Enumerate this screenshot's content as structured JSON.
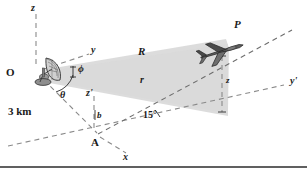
{
  "figure": {
    "background_color": "#ffffff",
    "beam_color": "#d9d9d9",
    "line_color": "#8a8a8a",
    "text_color": "#1a1a1a",
    "width": 307,
    "height": 171
  },
  "labels": {
    "z_axis": "z",
    "y_axis": "y",
    "x_axis": "x",
    "z_prime_axis": "z'",
    "y_prime_axis": "y'",
    "origin": "O",
    "plane_point": "P",
    "ground_point": "A",
    "range_R": "R",
    "range_r": "r",
    "altitude_z": "z",
    "baseline_distance": "3 km",
    "angle_phi": "ϕ",
    "angle_theta": "θ",
    "angle_fifteen": "15°",
    "b_label": "b"
  },
  "icons": {
    "radar_dish": "radar-dish-icon",
    "airplane": "airplane-icon"
  },
  "geometry": {
    "origin_point": [
      35,
      72
    ],
    "plane_point": [
      222,
      48
    ],
    "ground_point": [
      98,
      134
    ],
    "axis_z_top": [
      36,
      10
    ],
    "axis_y_end": [
      96,
      52
    ],
    "axis_y_prime_end": [
      288,
      84
    ],
    "axis_x_end": [
      130,
      152
    ],
    "axis_z_prime_top": [
      94,
      92
    ]
  }
}
